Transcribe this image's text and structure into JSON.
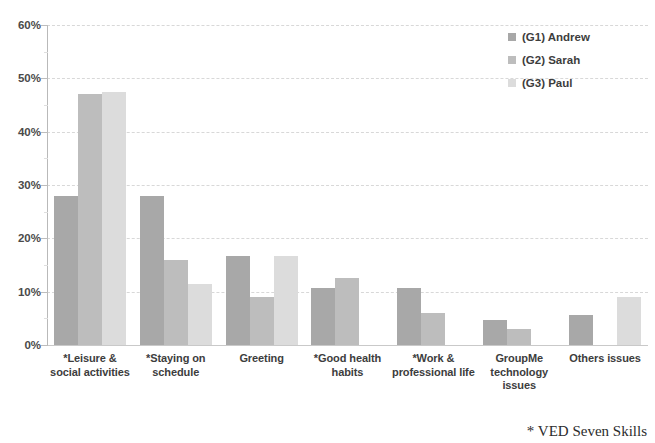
{
  "chart_data": {
    "type": "bar",
    "title": "",
    "subtitle": "",
    "xlabel": "",
    "ylabel": "",
    "ylim": [
      0,
      60
    ],
    "y_tick_labels": [
      "60%",
      "50%",
      "40%",
      "30%",
      "20%",
      "10%",
      "0%"
    ],
    "y_tick_values": [
      60,
      50,
      40,
      30,
      20,
      10,
      0
    ],
    "grid": "horizontal-dashed",
    "legend_position": "top-right",
    "value_unit": "%",
    "categories": [
      "*Leisure & social activities",
      "*Staying on schedule",
      "Greeting",
      "*Good health habits",
      "*Work & professional life",
      "GroupMe technology issues",
      "Others issues"
    ],
    "series": [
      {
        "name": "(G1) Andrew",
        "color": "#a8a8a8",
        "values": [
          28.0,
          28.0,
          16.7,
          10.7,
          10.7,
          4.7,
          5.7
        ]
      },
      {
        "name": "(G2) Sarah",
        "color": "#bdbdbd",
        "values": [
          47.0,
          16.0,
          9.0,
          12.5,
          6.0,
          3.0,
          0
        ]
      },
      {
        "name": "(G3) Paul",
        "color": "#dcdcdc",
        "values": [
          47.5,
          11.5,
          16.7,
          0,
          0,
          0,
          9.0
        ]
      }
    ],
    "annotations": [
      "* VED Seven Skills"
    ]
  },
  "legend": {
    "items": [
      {
        "label": "(G1) Andrew",
        "color": "#a8a8a8"
      },
      {
        "label": "(G2) Sarah",
        "color": "#bdbdbd"
      },
      {
        "label": "(G3) Paul",
        "color": "#dcdcdc"
      }
    ]
  },
  "footnote": {
    "text": "* VED Seven Skills"
  }
}
